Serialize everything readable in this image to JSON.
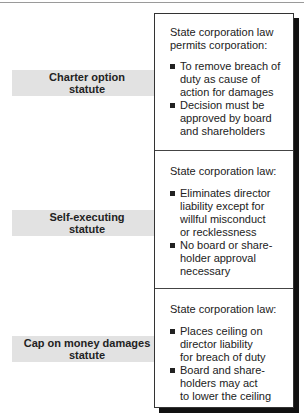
{
  "colors": {
    "arrow_fill": "#e2e2e2",
    "box_border": "#333333",
    "shadow": "#111111",
    "text": "#222222"
  },
  "rows": [
    {
      "arrow_label_line1": "Charter option",
      "arrow_label_line2": "statute",
      "panel": {
        "heading_line1": "State corporation law",
        "heading_line2": "permits corporation:",
        "bullets": [
          {
            "lines": [
              "To remove breach of",
              "duty as cause of",
              "action for damages"
            ]
          },
          {
            "lines": [
              "Decision must be",
              "approved by board",
              "and shareholders"
            ]
          }
        ]
      }
    },
    {
      "arrow_label_line1": "Self-executing",
      "arrow_label_line2": "statute",
      "panel": {
        "heading_line1": "State corporation law:",
        "bullets": [
          {
            "lines": [
              "Eliminates director",
              "liability except for",
              "willful misconduct",
              "or recklessness"
            ]
          },
          {
            "lines": [
              "No board or share-",
              "holder approval",
              "necessary"
            ]
          }
        ]
      }
    },
    {
      "arrow_label_line1": "Cap on money damages",
      "arrow_label_line2": "statute",
      "panel": {
        "heading_line1": "State corporation law:",
        "bullets": [
          {
            "lines": [
              "Places ceiling on",
              "director liability",
              "for breach of duty"
            ]
          },
          {
            "lines": [
              "Board and share-",
              "holders may act",
              "to lower the ceiling"
            ]
          }
        ]
      }
    }
  ]
}
